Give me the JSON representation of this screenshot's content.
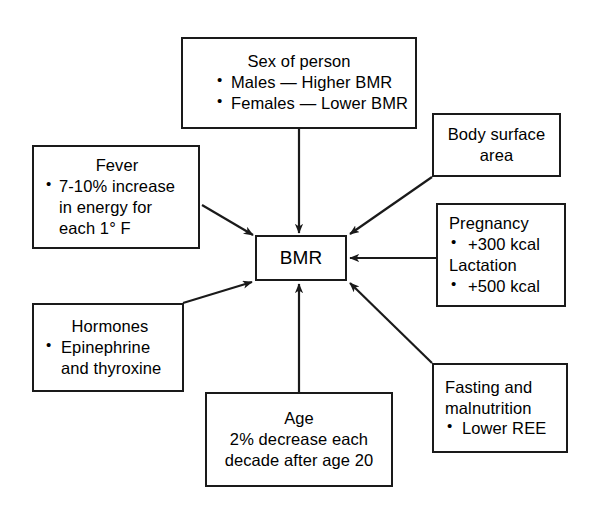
{
  "diagram": {
    "type": "radial-influence-diagram",
    "line_color": "#1a1a1a",
    "background_color": "#ffffff",
    "center": {
      "id": "bmr",
      "label": "BMR"
    },
    "nodes": [
      {
        "id": "sex",
        "title": "Sex of person",
        "items": [
          "Males — Higher BMR",
          "Females — Lower BMR"
        ],
        "arrow": "down"
      },
      {
        "id": "fever",
        "title": "Fever",
        "items": [
          "7-10% increase in energy for each 1° F"
        ],
        "arrow": "diagonal-down-right"
      },
      {
        "id": "body_surface",
        "title": "Body surface area",
        "items": [],
        "arrow": "diagonal-down-left"
      },
      {
        "id": "pregnancy",
        "title": "Pregnancy",
        "title2": "Lactation",
        "items": [
          "+300 kcal"
        ],
        "items2": [
          "+500 kcal"
        ],
        "arrow": "left"
      },
      {
        "id": "hormones",
        "title": "Hormones",
        "items": [
          "Epinephrine and thyroxine"
        ],
        "arrow": "diagonal-up-right"
      },
      {
        "id": "fasting",
        "title": "Fasting and malnutrition",
        "items": [
          "Lower REE"
        ],
        "arrow": "diagonal-up-left"
      },
      {
        "id": "age",
        "title": "Age",
        "lines": [
          "2% decrease each",
          "decade after age 20"
        ],
        "arrow": "up"
      }
    ]
  },
  "labels": {
    "sex_title": "Sex of person",
    "sex_item_1": "Males — Higher BMR",
    "sex_item_2": "Females — Lower BMR",
    "fever_title": "Fever",
    "fever_item_1": "7-10% increase in energy for each 1° F",
    "body_line_1": "Body surface",
    "body_line_2": "area",
    "preg_title": "Pregnancy",
    "preg_item_1": "+300 kcal",
    "preg_title_2": "Lactation",
    "preg_item_2": "+500 kcal",
    "hormones_title": "Hormones",
    "hormones_item_1": "Epinephrine",
    "hormones_item_1b": "and thyroxine",
    "fasting_title_1": "Fasting and",
    "fasting_title_2": "malnutrition",
    "fasting_item_1": "Lower REE",
    "age_title": "Age",
    "age_line_1": "2% decrease each",
    "age_line_2": "decade after age 20",
    "bmr_label": "BMR"
  }
}
